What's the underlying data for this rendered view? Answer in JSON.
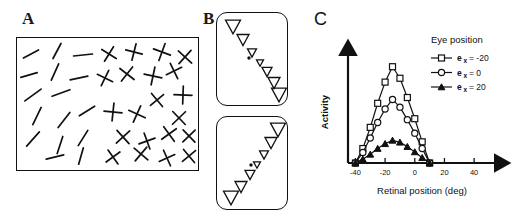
{
  "figure": {
    "panels": [
      {
        "id": "A",
        "label": "A"
      },
      {
        "id": "B",
        "label": "B"
      },
      {
        "id": "C",
        "label": "C"
      }
    ]
  },
  "panel_a": {
    "name": "texture-field-of-oriented-line-elements",
    "description": "Array of short oblique line segments on the left grading into crossed line pairs on the right",
    "border_color": "#111111",
    "element_color": "#111111",
    "singles": [
      {
        "x": 14,
        "y": 16,
        "len": 17,
        "angle": -28
      },
      {
        "x": 40,
        "y": 13,
        "len": 17,
        "angle": -62
      },
      {
        "x": 66,
        "y": 17,
        "len": 19,
        "angle": -6
      },
      {
        "x": 12,
        "y": 37,
        "len": 17,
        "angle": -16
      },
      {
        "x": 38,
        "y": 34,
        "len": 18,
        "angle": -66
      },
      {
        "x": 62,
        "y": 40,
        "len": 18,
        "angle": -12
      },
      {
        "x": 16,
        "y": 57,
        "len": 20,
        "angle": -36
      },
      {
        "x": 44,
        "y": 55,
        "len": 19,
        "angle": -20
      },
      {
        "x": 20,
        "y": 78,
        "len": 19,
        "angle": -64
      },
      {
        "x": 47,
        "y": 82,
        "len": 19,
        "angle": -52
      },
      {
        "x": 70,
        "y": 73,
        "len": 18,
        "angle": -32
      },
      {
        "x": 16,
        "y": 101,
        "len": 19,
        "angle": -48
      },
      {
        "x": 43,
        "y": 107,
        "len": 18,
        "angle": -72
      },
      {
        "x": 66,
        "y": 100,
        "len": 18,
        "angle": -58
      },
      {
        "x": 38,
        "y": 119,
        "len": 18,
        "angle": -14
      },
      {
        "x": 64,
        "y": 118,
        "len": 17,
        "angle": -74
      }
    ],
    "crosses": [
      {
        "x": 92,
        "y": 16,
        "len": 17,
        "angle": -58
      },
      {
        "x": 117,
        "y": 14,
        "len": 17,
        "angle": -76
      },
      {
        "x": 145,
        "y": 14,
        "len": 18,
        "angle": -70
      },
      {
        "x": 168,
        "y": 19,
        "len": 18,
        "angle": -48
      },
      {
        "x": 88,
        "y": 40,
        "len": 17,
        "angle": -64
      },
      {
        "x": 110,
        "y": 36,
        "len": 18,
        "angle": -52
      },
      {
        "x": 136,
        "y": 38,
        "len": 18,
        "angle": -78
      },
      {
        "x": 157,
        "y": 33,
        "len": 17,
        "angle": -26
      },
      {
        "x": 166,
        "y": 57,
        "len": 18,
        "angle": -88
      },
      {
        "x": 140,
        "y": 62,
        "len": 17,
        "angle": -40
      },
      {
        "x": 96,
        "y": 74,
        "len": 18,
        "angle": -84
      },
      {
        "x": 120,
        "y": 76,
        "len": 18,
        "angle": -66
      },
      {
        "x": 162,
        "y": 80,
        "len": 18,
        "angle": -44
      },
      {
        "x": 106,
        "y": 99,
        "len": 18,
        "angle": -42
      },
      {
        "x": 130,
        "y": 103,
        "len": 17,
        "angle": -20
      },
      {
        "x": 152,
        "y": 96,
        "len": 18,
        "angle": -36
      },
      {
        "x": 172,
        "y": 98,
        "len": 17,
        "angle": -44
      },
      {
        "x": 96,
        "y": 119,
        "len": 17,
        "angle": -36
      },
      {
        "x": 124,
        "y": 116,
        "len": 18,
        "angle": -50
      },
      {
        "x": 150,
        "y": 120,
        "len": 17,
        "angle": -24
      },
      {
        "x": 172,
        "y": 118,
        "len": 17,
        "angle": -40
      }
    ]
  },
  "panel_b": {
    "name": "triangle-array-stimulus-pair",
    "boxes": [
      {
        "id": "top",
        "name": "descending-triangle-array",
        "direction": "descending",
        "fixation_dot": {
          "x": 32,
          "y": 45
        },
        "triangles": [
          {
            "cx": 16,
            "cy": 14,
            "size": 15
          },
          {
            "cx": 26,
            "cy": 27,
            "size": 12
          },
          {
            "cx": 35,
            "cy": 40,
            "size": 9
          },
          {
            "cx": 43,
            "cy": 50,
            "size": 7
          },
          {
            "cx": 50,
            "cy": 59,
            "size": 10
          },
          {
            "cx": 57,
            "cy": 70,
            "size": 12
          },
          {
            "cx": 62,
            "cy": 82,
            "size": 15
          }
        ]
      },
      {
        "id": "bottom",
        "name": "ascending-triangle-array",
        "direction": "ascending",
        "fixation_dot": {
          "x": 34,
          "y": 48
        },
        "triangles": [
          {
            "cx": 14,
            "cy": 81,
            "size": 15
          },
          {
            "cx": 24,
            "cy": 70,
            "size": 12
          },
          {
            "cx": 33,
            "cy": 58,
            "size": 10
          },
          {
            "cx": 40,
            "cy": 48,
            "size": 7
          },
          {
            "cx": 47,
            "cy": 38,
            "size": 9
          },
          {
            "cx": 54,
            "cy": 26,
            "size": 12
          },
          {
            "cx": 61,
            "cy": 13,
            "size": 15
          }
        ]
      }
    ]
  },
  "chart_data": {
    "type": "line",
    "title": "",
    "xlabel": "Retinal position (deg)",
    "ylabel": "Activity",
    "xlim": [
      -45,
      48
    ],
    "ylim": [
      0,
      1.08
    ],
    "xticks": [
      -40,
      -20,
      0,
      20,
      40
    ],
    "xtick_labels": [
      "-40",
      "-20",
      "0",
      "20",
      "40"
    ],
    "yticks": [],
    "ytick_labels": [],
    "grid": false,
    "legend_position": "top-right",
    "legend_title": "Eye position",
    "x": [
      -40,
      -35,
      -30,
      -25,
      -20,
      -15,
      -10,
      -5,
      0,
      5,
      10
    ],
    "series": [
      {
        "name": "e_x = -20",
        "symbol": "e",
        "subscript": "x",
        "value_label": "= -20",
        "marker": "open-square",
        "values": [
          0.0,
          0.15,
          0.37,
          0.62,
          0.84,
          1.0,
          0.88,
          0.68,
          0.46,
          0.22,
          0.0
        ]
      },
      {
        "name": "e_x = 0",
        "symbol": "e",
        "subscript": "x",
        "value_label": "= 0",
        "marker": "open-circle",
        "values": [
          0.0,
          0.11,
          0.26,
          0.42,
          0.56,
          0.66,
          0.58,
          0.45,
          0.31,
          0.15,
          0.0
        ]
      },
      {
        "name": "e_x = 20",
        "symbol": "e",
        "subscript": "x",
        "value_label": "= 20",
        "marker": "filled-triangle",
        "values": [
          0.0,
          0.04,
          0.09,
          0.15,
          0.2,
          0.235,
          0.215,
          0.17,
          0.115,
          0.055,
          0.0
        ]
      }
    ]
  }
}
